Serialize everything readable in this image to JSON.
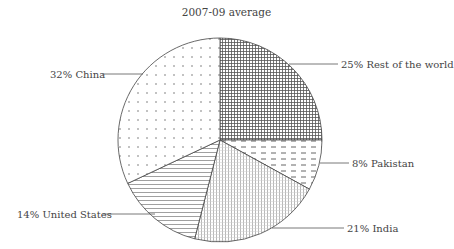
{
  "title": "2007-09 average",
  "chart_data": {
    "type": "pie",
    "title": "2007-09 average",
    "unit": "%",
    "start_angle": "12 o'clock, clockwise",
    "slices": [
      {
        "label": "Rest of the world",
        "value": 25,
        "display": "25% Rest of the world",
        "pattern": "crosshatch-dense"
      },
      {
        "label": "Pakistan",
        "value": 8,
        "display": "8% Pakistan",
        "pattern": "dashes"
      },
      {
        "label": "India",
        "value": 21,
        "display": "21% India",
        "pattern": "vertical-fine-grid"
      },
      {
        "label": "United States",
        "value": 14,
        "display": "14% United States",
        "pattern": "horizontal-lines"
      },
      {
        "label": "China",
        "value": 32,
        "display": "32% China",
        "pattern": "sparse-x-dots"
      }
    ],
    "legend": "none (leader-line labels)"
  }
}
